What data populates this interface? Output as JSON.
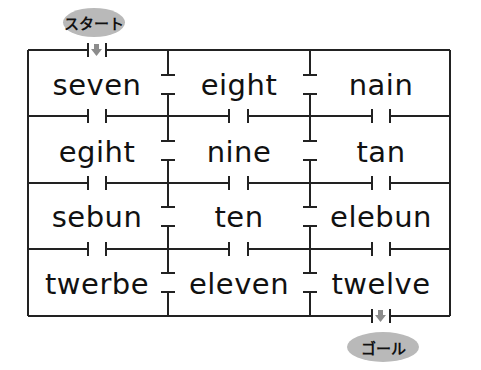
{
  "start_label": "スタート",
  "goal_label": "ゴール",
  "colors": {
    "line": "#222222",
    "pill": "#b9b9b9",
    "arrow": "#8c8c8c"
  },
  "grid": {
    "rows": 4,
    "cols": 3,
    "cells": [
      [
        "seven",
        "eight",
        "nain"
      ],
      [
        "egiht",
        "nine",
        "tan"
      ],
      [
        "sebun",
        "ten",
        "elebun"
      ],
      [
        "twerbe",
        "eleven",
        "twelve"
      ]
    ]
  },
  "words": {
    "r0c0": "seven",
    "r0c1": "eight",
    "r0c2": "nain",
    "r1c0": "egiht",
    "r1c1": "nine",
    "r1c2": "tan",
    "r2c0": "sebun",
    "r2c1": "ten",
    "r2c2": "elebun",
    "r3c0": "twerbe",
    "r3c1": "eleven",
    "r3c2": "twelve"
  }
}
